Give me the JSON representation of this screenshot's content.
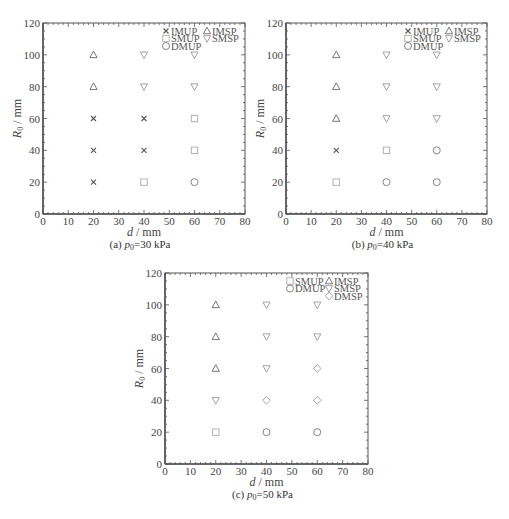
{
  "chart_data": [
    {
      "id": "a",
      "type": "scatter",
      "title": "",
      "caption": "(a) p0=30 kPa",
      "caption_prefix": "(a) ",
      "caption_var": "p",
      "caption_sub": "0",
      "caption_suffix": "=30 kPa",
      "xlabel": "d / mm",
      "ylabel": "R0 / mm",
      "xlim": [
        0,
        80
      ],
      "ylim": [
        0,
        120
      ],
      "xticks": [
        0,
        10,
        20,
        30,
        40,
        50,
        60,
        70,
        80
      ],
      "yticks": [
        0,
        20,
        40,
        60,
        80,
        100,
        120
      ],
      "grid": false,
      "legend_position": "upper right",
      "legend": [
        "IMUP",
        "SMUP",
        "DMUP",
        "IMSP",
        "SMSP"
      ],
      "series": [
        {
          "name": "IMUP",
          "marker": "x",
          "points": [
            [
              20,
              20
            ],
            [
              20,
              40
            ],
            [
              20,
              60
            ],
            [
              40,
              40
            ],
            [
              40,
              60
            ]
          ]
        },
        {
          "name": "SMUP",
          "marker": "square",
          "points": [
            [
              40,
              20
            ],
            [
              60,
              40
            ],
            [
              60,
              60
            ]
          ]
        },
        {
          "name": "DMUP",
          "marker": "circle",
          "points": [
            [
              60,
              20
            ]
          ]
        },
        {
          "name": "IMSP",
          "marker": "triangle-up",
          "points": [
            [
              20,
              80
            ],
            [
              20,
              100
            ]
          ]
        },
        {
          "name": "SMSP",
          "marker": "triangle-down",
          "points": [
            [
              40,
              80
            ],
            [
              40,
              100
            ],
            [
              60,
              80
            ],
            [
              60,
              100
            ]
          ]
        }
      ]
    },
    {
      "id": "b",
      "type": "scatter",
      "title": "",
      "caption": "(b) p0=40 kPa",
      "caption_prefix": "(b) ",
      "caption_var": "p",
      "caption_sub": "0",
      "caption_suffix": "=40 kPa",
      "xlabel": "d / mm",
      "ylabel": "R0 / mm",
      "xlim": [
        0,
        80
      ],
      "ylim": [
        0,
        120
      ],
      "xticks": [
        0,
        10,
        20,
        30,
        40,
        50,
        60,
        70,
        80
      ],
      "yticks": [
        0,
        20,
        40,
        60,
        80,
        100,
        120
      ],
      "grid": false,
      "legend_position": "upper right",
      "legend": [
        "IMUP",
        "SMUP",
        "DMUP",
        "IMSP",
        "SMSP"
      ],
      "series": [
        {
          "name": "IMUP",
          "marker": "x",
          "points": [
            [
              20,
              40
            ]
          ]
        },
        {
          "name": "SMUP",
          "marker": "square",
          "points": [
            [
              20,
              20
            ],
            [
              40,
              40
            ]
          ]
        },
        {
          "name": "DMUP",
          "marker": "circle",
          "points": [
            [
              40,
              20
            ],
            [
              60,
              20
            ],
            [
              60,
              40
            ]
          ]
        },
        {
          "name": "IMSP",
          "marker": "triangle-up",
          "points": [
            [
              20,
              60
            ],
            [
              20,
              80
            ],
            [
              20,
              100
            ]
          ]
        },
        {
          "name": "SMSP",
          "marker": "triangle-down",
          "points": [
            [
              40,
              60
            ],
            [
              40,
              80
            ],
            [
              40,
              100
            ],
            [
              60,
              60
            ],
            [
              60,
              80
            ],
            [
              60,
              100
            ]
          ]
        }
      ]
    },
    {
      "id": "c",
      "type": "scatter",
      "title": "",
      "caption": "(c) p0=50 kPa",
      "caption_prefix": "(c) ",
      "caption_var": "p",
      "caption_sub": "0",
      "caption_suffix": "=50 kPa",
      "xlabel": "d / mm",
      "ylabel": "R0 / mm",
      "xlim": [
        0,
        80
      ],
      "ylim": [
        0,
        120
      ],
      "xticks": [
        0,
        10,
        20,
        30,
        40,
        50,
        60,
        70,
        80
      ],
      "yticks": [
        0,
        20,
        40,
        60,
        80,
        100,
        120
      ],
      "grid": false,
      "legend_position": "upper right",
      "legend": [
        "SMUP",
        "DMUP",
        "IMSP",
        "SMSP",
        "DMSP"
      ],
      "series": [
        {
          "name": "SMUP",
          "marker": "square",
          "points": [
            [
              20,
              20
            ]
          ]
        },
        {
          "name": "DMUP",
          "marker": "circle",
          "points": [
            [
              40,
              20
            ],
            [
              60,
              20
            ]
          ]
        },
        {
          "name": "IMSP",
          "marker": "triangle-up",
          "points": [
            [
              20,
              60
            ],
            [
              20,
              80
            ],
            [
              20,
              100
            ]
          ]
        },
        {
          "name": "SMSP",
          "marker": "triangle-down",
          "points": [
            [
              20,
              40
            ],
            [
              40,
              60
            ],
            [
              40,
              80
            ],
            [
              40,
              100
            ],
            [
              60,
              80
            ],
            [
              60,
              100
            ]
          ]
        },
        {
          "name": "DMSP",
          "marker": "diamond",
          "points": [
            [
              40,
              40
            ],
            [
              60,
              40
            ],
            [
              60,
              60
            ]
          ]
        }
      ]
    }
  ],
  "marker_colors": {
    "IMUP": "#555555",
    "SMUP": "#aaaaaa",
    "DMUP": "#777777",
    "IMSP": "#666666",
    "SMSP": "#999999",
    "DMSP": "#999999"
  },
  "axis_color": "#555555",
  "axis_labels": {
    "x_var": "d",
    "x_unit": "/ mm",
    "y_var": "R",
    "y_sub": "0",
    "y_unit": "/ mm"
  }
}
